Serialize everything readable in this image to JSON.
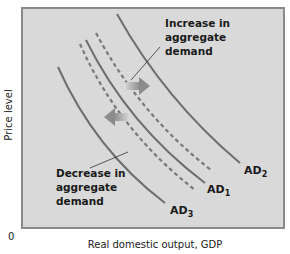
{
  "diagram": {
    "title": "",
    "y_axis_label": "Price level",
    "x_axis_label": "Real domestic output, GDP",
    "origin_label": "0",
    "colors": {
      "plot_background": "#d9d9d9",
      "plot_border": "#8a8a8a",
      "curve": "#6e6e6e",
      "dashed": "#7a7a7a",
      "arrow": "#9a9a9a",
      "text": "#1a1a1a"
    },
    "curves": [
      {
        "id": "AD2",
        "label": "AD",
        "subscript": "2",
        "style": "solid"
      },
      {
        "id": "AD1",
        "label": "AD",
        "subscript": "1",
        "style": "solid"
      },
      {
        "id": "AD3",
        "label": "AD",
        "subscript": "3",
        "style": "solid"
      }
    ],
    "annotations": {
      "increase": [
        "Increase in",
        "aggregate",
        "demand"
      ],
      "decrease": [
        "Decrease in",
        "aggregate",
        "demand"
      ]
    }
  }
}
